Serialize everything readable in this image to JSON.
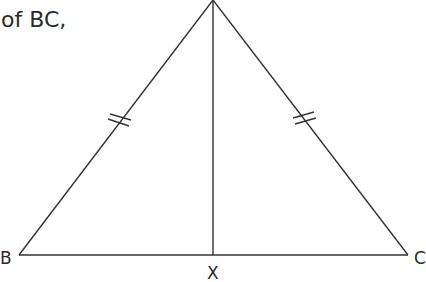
{
  "text": {
    "line1_partial": "...on of the",
    "line2": "of BC,"
  },
  "labels": {
    "B": "B",
    "C": "C",
    "X": "X"
  },
  "colors": {
    "line": "#333333",
    "text": "#2a2a2a",
    "background": "#ffffff"
  }
}
